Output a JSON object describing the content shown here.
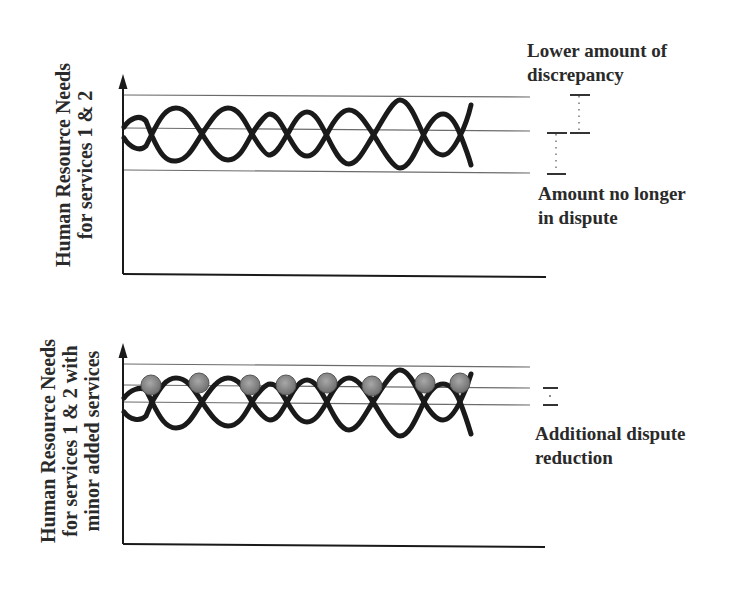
{
  "top_panel": {
    "y_axis_label_line1": "Human Resource Needs",
    "y_axis_label_line2": "for services 1 & 2",
    "annotation_upper": {
      "line1": "Lower amount of",
      "line2": "discrepancy"
    },
    "annotation_lower": {
      "line1": "Amount no longer",
      "line2": "in dispute"
    }
  },
  "bottom_panel": {
    "y_axis_label_line1": "Human Resource Needs",
    "y_axis_label_line2": "for services 1 & 2 with",
    "y_axis_label_line3": "minor added services",
    "annotation": {
      "line1": "Additional dispute",
      "line2": "reduction"
    },
    "marker_count": 8
  },
  "colors": {
    "ink": "#1a1a1a",
    "guide_line": "#6b6b6b",
    "marker_fill": "#8a8a8a",
    "marker_stroke": "#555555",
    "text": "#2a2a2a"
  }
}
